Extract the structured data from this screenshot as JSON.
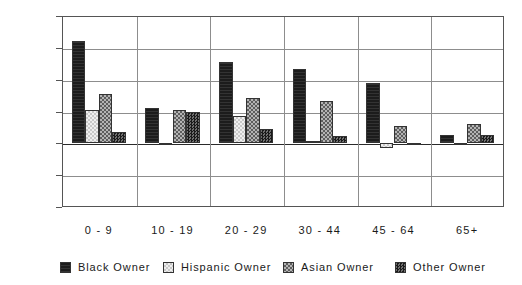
{
  "chart_data": {
    "type": "bar",
    "title": "",
    "subtitle": "",
    "xlabel": "",
    "ylabel": "",
    "categories": [
      "0 - 9",
      "10 - 19",
      "20 - 29",
      "30 - 44",
      "45 - 64",
      "65+"
    ],
    "ylim": [
      0.9,
      1.2
    ],
    "yticks": [
      "1.20",
      "1.15",
      "1.10",
      "1.05",
      "1.00",
      "0.95",
      "0.90"
    ],
    "ytick_values": [
      1.2,
      1.15,
      1.1,
      1.05,
      1.0,
      0.95,
      0.9
    ],
    "baseline": 1.0,
    "grid": true,
    "legend_position": "bottom",
    "series": [
      {
        "name": "Black Owner",
        "pattern": "solid-black",
        "color": "#1c1c1c",
        "values": [
          1.16,
          1.056,
          1.127,
          1.116,
          1.094,
          1.013
        ]
      },
      {
        "name": "Hispanic Owner",
        "pattern": "light-checker",
        "color": "#dcdcdc",
        "values": [
          1.052,
          1.0,
          1.043,
          1.003,
          0.993,
          0.997
        ]
      },
      {
        "name": "Asian Owner",
        "pattern": "medium-checker",
        "color": "#8a8a8a",
        "values": [
          1.077,
          1.053,
          1.071,
          1.066,
          1.028,
          1.03
        ]
      },
      {
        "name": "Other Owner",
        "pattern": "dark-checker",
        "color": "#3a3a3a",
        "values": [
          1.018,
          1.049,
          1.022,
          1.011,
          1.0,
          1.013
        ]
      }
    ]
  }
}
